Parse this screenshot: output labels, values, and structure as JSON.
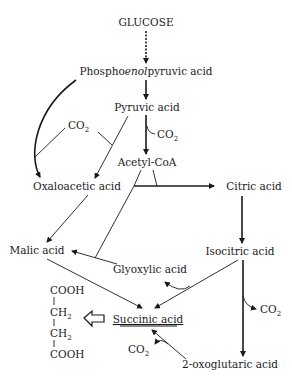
{
  "diagram": {
    "nodes": {
      "glucose": "GLUCOSE",
      "pep_prefix": "Phospho",
      "pep_italic": "enol",
      "pep_suffix": "pyruvic acid",
      "pyruvic": "Pyruvic acid",
      "acetyl_coa": "Acetyl-CoA",
      "oxaloacetic": "Oxaloacetic acid",
      "citric": "Citric acid",
      "malic": "Malic acid",
      "isocitric": "Isocitric acid",
      "glyoxylic": "Glyoxylic acid",
      "succinic": "Succinic acid",
      "oxoglutaric": "2-oxoglutaric acid"
    },
    "co2": {
      "main": "CO",
      "sub": "2"
    },
    "structure": {
      "cooh_top": "COOH",
      "ch2_main": "CH",
      "ch2_sub": "2",
      "cooh_bottom": "COOH"
    },
    "edges": [
      {
        "from": "GLUCOSE",
        "to": "Phosphoenolpyruvic acid",
        "style": "dotted"
      },
      {
        "from": "Phosphoenolpyruvic acid",
        "to": "Pyruvic acid"
      },
      {
        "from": "Phosphoenolpyruvic acid",
        "to": "Oxaloacetic acid",
        "with": "CO2"
      },
      {
        "from": "Pyruvic acid",
        "to": "Acetyl-CoA",
        "releases": "CO2"
      },
      {
        "from": "Pyruvic acid",
        "to": "Oxaloacetic acid",
        "with": "CO2"
      },
      {
        "from": "Acetyl-CoA",
        "to": "Citric acid",
        "with": "Oxaloacetic acid"
      },
      {
        "from": "Citric acid",
        "to": "Isocitric acid"
      },
      {
        "from": "Isocitric acid",
        "to": "2-oxoglutaric acid",
        "releases": "CO2"
      },
      {
        "from": "Isocitric acid",
        "to": "Succinic acid",
        "releases": "Glyoxylic acid"
      },
      {
        "from": "Glyoxylic acid",
        "to": "Malic acid",
        "with": "Acetyl-CoA"
      },
      {
        "from": "Oxaloacetic acid",
        "to": "Malic acid"
      },
      {
        "from": "Malic acid",
        "to": "Succinic acid"
      },
      {
        "from": "2-oxoglutaric acid",
        "to": "Succinic acid",
        "releases": "CO2"
      }
    ]
  }
}
